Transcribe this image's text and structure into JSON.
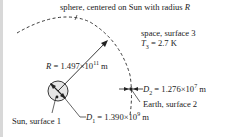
{
  "diagram": {
    "labels": {
      "sphere": "sphere, centered on Sun with radius",
      "sphere_var": "R",
      "space_line1": "space, surface 3",
      "space_T_var": "T",
      "space_T_sub": "3",
      "space_T_val": " = 2.7 K",
      "R_var": "R",
      "R_val": " = 1.497×10",
      "R_exp": "11",
      "R_unit": " m",
      "D2_var": "D",
      "D2_sub": "2",
      "D2_val": " = 1.276×10",
      "D2_exp": "7",
      "D2_unit": " m",
      "earth": "Earth, surface 2",
      "D1_var": "D",
      "D1_sub": "1",
      "D1_val": " = 1.390×10",
      "D1_exp": "9",
      "D1_unit": " m",
      "sun": "Sun, surface 1"
    },
    "colors": {
      "line": "#222222",
      "sun_fill": "#e6e6e6"
    }
  }
}
